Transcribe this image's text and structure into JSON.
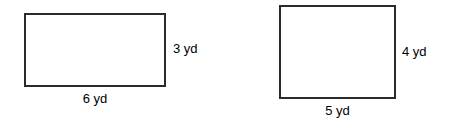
{
  "page": {
    "background_color": "#ffffff",
    "stroke_color": "#2b2b2b",
    "text_color": "#000000",
    "width": 455,
    "height": 127
  },
  "figures": [
    {
      "id": "figure-1",
      "shape": "rectangle",
      "height_label": "3 yd",
      "width_label": "6 yd",
      "height_value": 3,
      "width_value": 6,
      "unit": "yd"
    },
    {
      "id": "figure-2",
      "shape": "rectangle",
      "height_label": "4 yd",
      "width_label": "5 yd",
      "height_value": 4,
      "width_value": 5,
      "unit": "yd"
    }
  ]
}
